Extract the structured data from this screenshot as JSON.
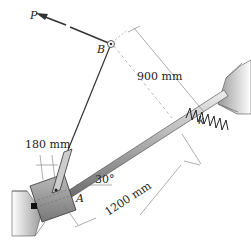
{
  "figure": {
    "labels": {
      "force": "P",
      "pivot_top": "B",
      "collar": "A",
      "spring": "k",
      "dim_vertical": "900 mm",
      "dim_rod": "1200 mm",
      "dim_collar": "180 mm",
      "angle": "30°"
    },
    "colors": {
      "line": "#333333",
      "dim_line": "#777777",
      "wall_fill": "#dddddd",
      "collar_fill": "#9a9a9a",
      "rod_fill": "#bbbbbb"
    }
  }
}
